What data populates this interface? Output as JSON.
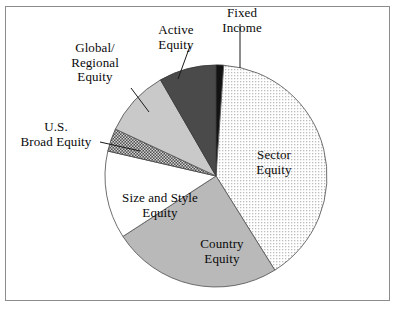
{
  "figure": {
    "border_color": "#8d8d8d",
    "background": "#ffffff"
  },
  "chart_data": {
    "type": "pie",
    "title": "",
    "subtitle": "",
    "xlabel": "",
    "ylabel": "",
    "legend_position": "none",
    "grid": false,
    "start_angle_deg": 0,
    "direction": "clockwise",
    "center": {
      "x": 216,
      "y": 176
    },
    "radius": 111,
    "categories": [
      "Fixed Income",
      "Sector Equity",
      "Country Equity",
      "Size and Style Equity",
      "U.S. Broad Equity",
      "Global/Regional Equity",
      "Active Equity"
    ],
    "values": [
      1.1,
      40.0,
      24.7,
      12.8,
      3.3,
      9.7,
      8.4
    ],
    "angles_deg": [
      4,
      144,
      89,
      46,
      12,
      35,
      30
    ],
    "slices": [
      {
        "label": "Fixed Income",
        "label_lines": [
          "Fixed",
          "Income"
        ],
        "value": 1.1,
        "start_deg": 0,
        "end_deg": 4,
        "fill": "#131313",
        "pattern": "solid-black",
        "label_placement": "callout",
        "stroke": "#1a1a1a"
      },
      {
        "label": "Sector Equity",
        "label_lines": [
          "Sector",
          "Equity"
        ],
        "value": 40.0,
        "start_deg": 4,
        "end_deg": 148,
        "fill": "#f2f2f2",
        "pattern": "fine-dots",
        "label_placement": "inside",
        "stroke": "#5d5d5d"
      },
      {
        "label": "Country Equity",
        "label_lines": [
          "Country",
          "Equity"
        ],
        "value": 24.7,
        "start_deg": 148,
        "end_deg": 237,
        "fill": "#b9b9b9",
        "pattern": "solid-gray",
        "label_placement": "inside",
        "stroke": "#5d5d5d"
      },
      {
        "label": "Size and Style Equity",
        "label_lines": [
          "Size and Style",
          "Equity"
        ],
        "value": 12.8,
        "start_deg": 237,
        "end_deg": 283,
        "fill": "#ffffff",
        "pattern": "solid-white",
        "label_placement": "inside",
        "stroke": "#5d5d5d"
      },
      {
        "label": "U.S. Broad Equity",
        "label_lines": [
          "U.S.",
          "Broad Equity"
        ],
        "value": 3.3,
        "start_deg": 283,
        "end_deg": 295,
        "fill": "#6e6e6e",
        "pattern": "checker",
        "label_placement": "callout",
        "stroke": "#4a4a4a"
      },
      {
        "label": "Global/Regional Equity",
        "label_lines": [
          "Global/",
          "Regional",
          "Equity"
        ],
        "value": 9.7,
        "start_deg": 295,
        "end_deg": 330,
        "fill": "#c9c9c9",
        "pattern": "solid-lightgray",
        "label_placement": "callout",
        "stroke": "#5d5d5d"
      },
      {
        "label": "Active Equity",
        "label_lines": [
          "Active",
          "Equity"
        ],
        "value": 8.4,
        "start_deg": 330,
        "end_deg": 360,
        "fill": "#4a4a4a",
        "pattern": "solid-darkgray",
        "label_placement": "callout",
        "stroke": "#3a3a3a"
      }
    ]
  },
  "labels": {
    "fixed_income": "Fixed\nIncome",
    "active_equity": "Active\nEquity",
    "global_regional_equity": "Global/\nRegional\nEquity",
    "us_broad_equity": "U.S.\nBroad Equity",
    "size_and_style_equity": "Size and Style\nEquity",
    "country_equity": "Country\nEquity",
    "sector_equity": "Sector\nEquity"
  }
}
